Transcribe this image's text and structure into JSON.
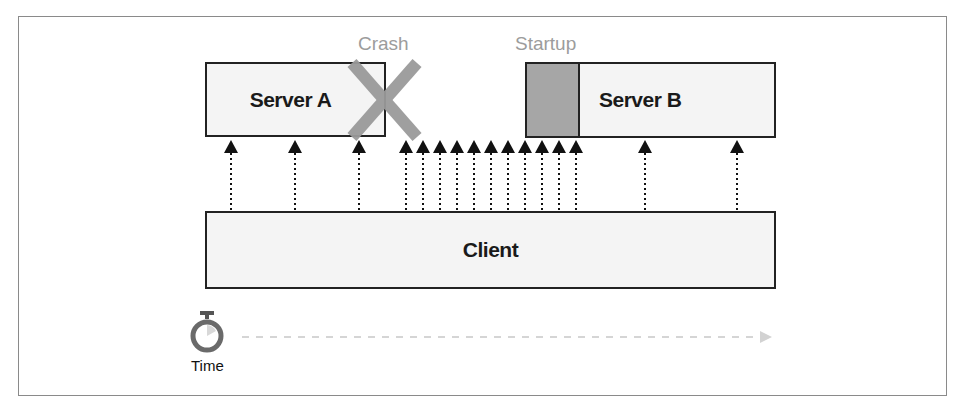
{
  "diagram": {
    "server_a": {
      "label": "Server A"
    },
    "server_b": {
      "label": "Server B"
    },
    "client": {
      "label": "Client"
    },
    "annotations": {
      "crash": "Crash",
      "startup": "Startup"
    },
    "time": {
      "label": "Time",
      "icon": "stopwatch-icon"
    },
    "requests": {
      "to_server_a_x": [
        231,
        295,
        359
      ],
      "burst_during_outage_x": [
        406,
        423,
        440,
        457,
        474,
        491,
        508,
        525,
        542,
        559,
        576
      ],
      "to_server_b_x": [
        645,
        737
      ],
      "total_count": 16
    },
    "colors": {
      "box_border": "#222222",
      "box_fill": "#f4f4f4",
      "crash_x": "#9a9a9a",
      "startup_fill": "#a6a6a6",
      "annotation_text": "#9c9c9c",
      "time_arrow": "#c8c8c8"
    }
  }
}
